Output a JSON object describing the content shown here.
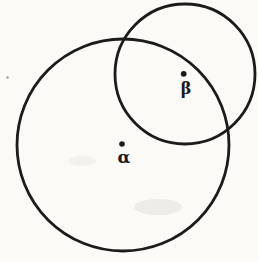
{
  "page": {
    "paper_color": "#fbfaf7",
    "width": 258,
    "height": 262
  },
  "diagram": {
    "type": "venn-two-circles",
    "ink_color": "#1b1b1b",
    "stroke_width": 2.8,
    "circles": [
      {
        "id": "alpha-circle",
        "cx": 123,
        "cy": 145,
        "r": 106
      },
      {
        "id": "beta-circle",
        "cx": 185,
        "cy": 74,
        "r": 70
      }
    ],
    "points": [
      {
        "label": "α",
        "dot": {
          "cx": 122,
          "cy": 144,
          "r": 2.8
        },
        "text": {
          "x": 124,
          "y": 163,
          "font_size": 17
        }
      },
      {
        "label": "β",
        "dot": {
          "cx": 183.7,
          "cy": 73.8,
          "r": 2.9
        },
        "text": {
          "x": 186,
          "y": 93.5,
          "font_size": 16
        }
      }
    ],
    "artifacts": {
      "speck": {
        "cx": 7.5,
        "cy": 77.5,
        "r": 1.2,
        "color": "#55524c",
        "opacity": 0.55
      },
      "smudges": [
        {
          "cx": 158,
          "cy": 207,
          "rx": 24,
          "ry": 8,
          "color": "#e8e5df",
          "opacity": 0.7
        },
        {
          "cx": 82,
          "cy": 161,
          "rx": 14,
          "ry": 5,
          "color": "#edebe5",
          "opacity": 0.6
        }
      ]
    }
  }
}
